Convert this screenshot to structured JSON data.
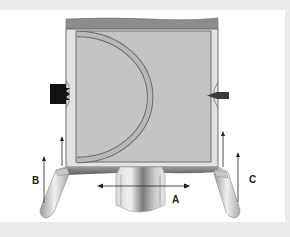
{
  "diagram": {
    "type": "technical-schematic",
    "labels": {
      "a": "A",
      "b": "B",
      "c": "C"
    },
    "arrows": [
      {
        "id": "A",
        "direction": "horizontal-bidirectional",
        "position": "below tank, across outlet"
      },
      {
        "id": "B",
        "direction": "upward",
        "count": 2,
        "position": "left side"
      },
      {
        "id": "C",
        "direction": "upward",
        "count": 2,
        "position": "right side"
      }
    ],
    "components": [
      "top-lid",
      "tank-body",
      "semicircular-insert",
      "left-sensor",
      "right-sensor",
      "bottom-plate",
      "outlet-nozzle",
      "left-leg",
      "right-leg"
    ],
    "colors": {
      "background_frame": "#ebebeb",
      "panel": "#ffffff",
      "lid": "#8c8c8c",
      "tank_outer": "#dcdcdc",
      "tank_inner": "#c4c4c4",
      "insert": "#b4b4b4",
      "left_sensor": "#111111",
      "right_sensor": "#3a3a3a",
      "bottom_plate": "#7a7a7a",
      "arrow": "#222222"
    }
  }
}
